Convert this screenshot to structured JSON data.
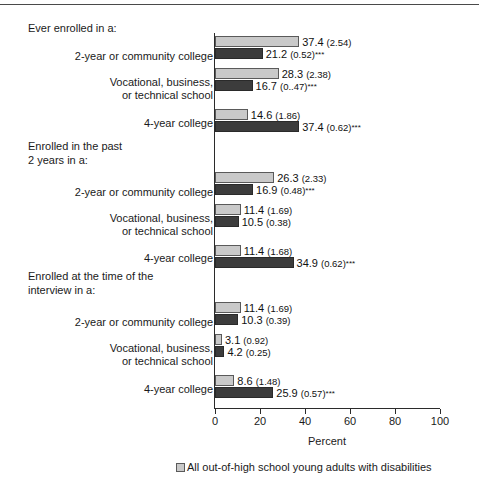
{
  "chart_data": {
    "type": "bar",
    "title": "",
    "xlabel": "Percent",
    "ylabel": "",
    "xlim": [
      0,
      100
    ],
    "xticks": [
      0,
      20,
      40,
      60,
      80,
      100
    ],
    "xtick_labels": [
      "0",
      "20",
      "40",
      "60",
      "80",
      "100"
    ],
    "grid": false,
    "orientation": "horizontal",
    "legend_position": "bottom",
    "series": [
      {
        "name": "All out-of-high school young adults with disabilities",
        "color": "#c9c9c9",
        "values": [
          37.4,
          28.3,
          14.6,
          26.3,
          11.4,
          11.4,
          11.4,
          3.1,
          8.6
        ]
      },
      {
        "name": "",
        "color": "#3c3c3c",
        "values": [
          21.2,
          16.7,
          37.4,
          16.9,
          10.5,
          34.9,
          10.3,
          4.2,
          25.9
        ]
      }
    ],
    "groups": [
      {
        "heading": "Ever enrolled in a:",
        "categories": [
          {
            "label": "2-year or community college",
            "light": {
              "value": 37.4,
              "se": "(2.54)",
              "sig": ""
            },
            "dark": {
              "value": 21.2,
              "se": "(0.52)",
              "sig": "***"
            }
          },
          {
            "label": "Vocational, business,\nor technical school",
            "light": {
              "value": 28.3,
              "se": "(2.38)",
              "sig": ""
            },
            "dark": {
              "value": 16.7,
              "se": "(0..47)",
              "sig": "***"
            }
          },
          {
            "label": "4-year college",
            "light": {
              "value": 14.6,
              "se": "(1.86)",
              "sig": ""
            },
            "dark": {
              "value": 37.4,
              "se": "(0.62)",
              "sig": "***"
            }
          }
        ]
      },
      {
        "heading": "Enrolled in the past\n2 years in a:",
        "categories": [
          {
            "label": "2-year or community college",
            "light": {
              "value": 26.3,
              "se": "(2.33)",
              "sig": ""
            },
            "dark": {
              "value": 16.9,
              "se": "(0.48)",
              "sig": "***"
            }
          },
          {
            "label": "Vocational, business,\nor technical school",
            "light": {
              "value": 11.4,
              "se": "(1.69)",
              "sig": ""
            },
            "dark": {
              "value": 10.5,
              "se": "(0.38)",
              "sig": ""
            }
          },
          {
            "label": "4-year college",
            "light": {
              "value": 11.4,
              "se": "(1.68)",
              "sig": ""
            },
            "dark": {
              "value": 34.9,
              "se": "(0.62)",
              "sig": "***"
            }
          }
        ]
      },
      {
        "heading": "Enrolled at the time of the\ninterview in a:",
        "categories": [
          {
            "label": "2-year or community college",
            "light": {
              "value": 11.4,
              "se": "(1.69)",
              "sig": ""
            },
            "dark": {
              "value": 10.3,
              "se": "(0.39)",
              "sig": ""
            }
          },
          {
            "label": "Vocational, business,\nor technical school",
            "light": {
              "value": 3.1,
              "se": "(0.92)",
              "sig": ""
            },
            "dark": {
              "value": 4.2,
              "se": "(0.25)",
              "sig": ""
            }
          },
          {
            "label": "4-year college",
            "light": {
              "value": 8.6,
              "se": "(1.48)",
              "sig": ""
            },
            "dark": {
              "value": 25.9,
              "se": "(0.57)",
              "sig": "***"
            }
          }
        ]
      }
    ]
  },
  "headings": {
    "g0": "Ever enrolled in a:",
    "g1": "Enrolled in the past\n2 years in a:",
    "g2": "Enrolled at the time of the\ninterview in a:"
  },
  "labels": {
    "c0": "2-year or community college",
    "c1": "Vocational, business,\nor technical school",
    "c2": "4-year college",
    "c3": "2-year or community college",
    "c4": "Vocational, business,\nor technical school",
    "c5": "4-year college",
    "c6": "2-year or community college",
    "c7": "Vocational, business,\nor technical school",
    "c8": "4-year college"
  },
  "axis": {
    "title": "Percent",
    "ticks": [
      "0",
      "20",
      "40",
      "60",
      "80",
      "100"
    ]
  },
  "legend": {
    "entry0": "All out-of-high school young adults with disabilities"
  },
  "colors": {
    "light_bar": "#c9c9c9",
    "dark_bar": "#3c3c3c",
    "axis": "#2b2b2b",
    "text": "#1a1a1a"
  }
}
